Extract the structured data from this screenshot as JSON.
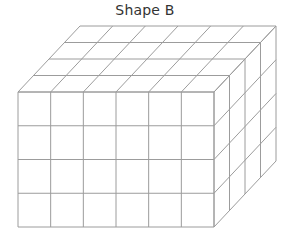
{
  "figure": {
    "title": "Shape B",
    "shape": {
      "type": "rectangular-prism-of-unit-cubes",
      "width_cubes": 6,
      "height_cubes": 4,
      "depth_cubes": 4,
      "line_color": "#9c9c9c"
    }
  }
}
